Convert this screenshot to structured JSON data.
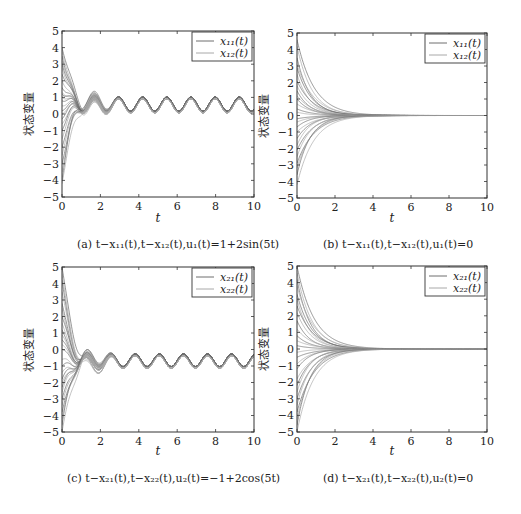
{
  "figure": {
    "panels": [
      {
        "id": "a",
        "caption": "(a) t−x₁₁(t),t−x₁₂(t),u₁(t)=1+2sin(5t)",
        "ylabel": "状态变量",
        "xlabel": "t",
        "legend": [
          "x₁₁(t)",
          "x₁₂(t)"
        ]
      },
      {
        "id": "b",
        "caption": "(b) t−x₁₁(t),t−x₁₂(t),u₁(t)=0",
        "ylabel": "状态变量",
        "xlabel": "t",
        "legend": [
          "x₁₁(t)",
          "x₁₂(t)"
        ]
      },
      {
        "id": "c",
        "caption": "(c) t−x₂₁(t),t−x₂₂(t),u₂(t)=−1+2cos(5t)",
        "ylabel": "状态变量",
        "xlabel": "t",
        "legend": [
          "x₂₁(t)",
          "x₂₂(t)"
        ]
      },
      {
        "id": "d",
        "caption": "(d) t−x₂₁(t),t−x₂₂(t),u₂(t)=0",
        "ylabel": "状态变量",
        "xlabel": "t",
        "legend": [
          "x₂₁(t)",
          "x₂₂(t)"
        ]
      }
    ],
    "colors": {
      "axis": "#333333",
      "line1": "#6e6e6e",
      "line2": "#a8a8a8",
      "background": "#ffffff"
    }
  },
  "chart_data": [
    {
      "type": "line",
      "title": "(a) t−x₁₁(t), t−x₁₂(t), u₁(t)=1+2sin(5t)",
      "xlabel": "t",
      "ylabel": "状态变量",
      "xlim": [
        0,
        10
      ],
      "ylim": [
        -5,
        5
      ],
      "xticks": [
        0,
        2,
        4,
        6,
        8,
        10
      ],
      "yticks": [
        -5,
        -4,
        -3,
        -2,
        -1,
        0,
        1,
        2,
        3,
        4,
        5
      ],
      "legend": [
        "x₁₁(t)",
        "x₁₂(t)"
      ],
      "legend_position": "upper right",
      "grid": false,
      "description": "Many trajectories from initial values in [-4.2, 4] converge by t≈3 to a periodic oscillation (period ≈1.26) in two bands",
      "initial_values": [
        4.0,
        3.8,
        3.5,
        3.2,
        3.0,
        2.8,
        2.4,
        2.0,
        1.6,
        1.3,
        1.2,
        1.0,
        0.8,
        0.5,
        0.2,
        0.0,
        -0.3,
        -0.6,
        -1.0,
        -1.5,
        -2.0,
        -2.5,
        -3.0,
        -3.5,
        -4.0,
        -4.2
      ],
      "series": [
        {
          "name": "x₁₁(t) steady state",
          "x": [
            4.4,
            5.0,
            5.6,
            6.3,
            6.9,
            7.5,
            8.2,
            8.8,
            9.4,
            10.0
          ],
          "values": [
            1.1,
            0.35,
            1.1,
            0.35,
            1.1,
            0.35,
            1.1,
            0.35,
            1.1,
            0.4
          ]
        },
        {
          "name": "x₁₂(t) steady state",
          "x": [
            4.4,
            5.0,
            5.6,
            6.3,
            6.9,
            7.5,
            8.2,
            8.8,
            9.4,
            10.0
          ],
          "values": [
            0.9,
            0.1,
            0.9,
            0.1,
            0.9,
            0.1,
            0.9,
            0.1,
            0.9,
            0.2
          ]
        }
      ],
      "mode": "oscillate",
      "center": 0.6,
      "amp": 0.42,
      "band_offset": 0.22,
      "decay": 1.6
    },
    {
      "type": "line",
      "title": "(b) t−x₁₁(t), t−x₁₂(t), u₁(t)=0",
      "xlabel": "t",
      "ylabel": "状态变量",
      "xlim": [
        0,
        10
      ],
      "ylim": [
        -5,
        5
      ],
      "xticks": [
        0,
        2,
        4,
        6,
        8,
        10
      ],
      "yticks": [
        -5,
        -4,
        -3,
        -2,
        -1,
        0,
        1,
        2,
        3,
        4,
        5
      ],
      "legend": [
        "x₁₁(t)",
        "x₁₂(t)"
      ],
      "legend_position": "upper right",
      "grid": false,
      "description": "Trajectories from initial values in [-4.2, 4.6] decay exponentially to 0 by t≈4",
      "initial_values": [
        4.6,
        4.2,
        3.5,
        3.1,
        2.9,
        2.5,
        2.1,
        1.8,
        1.5,
        1.2,
        1.0,
        0.7,
        0.4,
        0.2,
        -0.2,
        -0.4,
        -0.7,
        -1.0,
        -1.4,
        -1.8,
        -2.1,
        -2.5,
        -2.9,
        -3.2,
        -3.6,
        -4.2
      ],
      "series": [
        {
          "name": "x₁₁(t), x₁₂(t) envelope",
          "x": [
            0,
            1,
            2,
            3,
            4,
            6,
            8,
            10
          ],
          "values": [
            4.6,
            1.5,
            0.4,
            0.1,
            0.0,
            0.0,
            0.0,
            0.0
          ]
        }
      ],
      "mode": "decay",
      "decay": 1.3
    },
    {
      "type": "line",
      "title": "(c) t−x₂₁(t), t−x₂₂(t), u₂(t)=−1+2cos(5t)",
      "xlabel": "t",
      "ylabel": "状态变量",
      "xlim": [
        0,
        10
      ],
      "ylim": [
        -5,
        5
      ],
      "xticks": [
        0,
        2,
        4,
        6,
        8,
        10
      ],
      "yticks": [
        -5,
        -4,
        -3,
        -2,
        -1,
        0,
        1,
        2,
        3,
        4,
        5
      ],
      "legend": [
        "x₂₁(t)",
        "x₂₂(t)"
      ],
      "legend_position": "upper right",
      "grid": false,
      "description": "Trajectories from initial values in [-5, 5] converge by t≈3 to a periodic oscillation around -0.6 (period ≈1.26)",
      "initial_values": [
        5.0,
        4.6,
        4.2,
        3.5,
        2.8,
        2.5,
        2.0,
        1.6,
        1.2,
        0.9,
        0.6,
        0.3,
        0.0,
        -0.6,
        -1.0,
        -1.4,
        -1.8,
        -2.0,
        -2.3,
        -2.6,
        -3.0,
        -3.4,
        -3.8,
        -4.2,
        -4.6,
        -5.0
      ],
      "series": [
        {
          "name": "x₂₁(t) steady state",
          "x": [
            4.0,
            4.6,
            5.3,
            5.9,
            6.5,
            7.2,
            7.8,
            8.4,
            9.1,
            9.7
          ],
          "values": [
            -0.2,
            -0.9,
            -0.2,
            -0.9,
            -0.2,
            -0.9,
            -0.2,
            -0.9,
            -0.2,
            -0.9
          ]
        },
        {
          "name": "x₂₂(t) steady state",
          "x": [
            4.0,
            4.6,
            5.3,
            5.9,
            6.5,
            7.2,
            7.8,
            8.4,
            9.1,
            9.7
          ],
          "values": [
            -0.4,
            -1.15,
            -0.4,
            -1.15,
            -0.4,
            -1.15,
            -0.4,
            -1.15,
            -0.4,
            -1.15
          ]
        }
      ],
      "mode": "oscillate",
      "center": -0.65,
      "amp": 0.38,
      "band_offset": 0.22,
      "decay": 1.6
    },
    {
      "type": "line",
      "title": "(d) t−x₂₁(t), t−x₂₂(t), u₂(t)=0",
      "xlabel": "t",
      "ylabel": "状态变量",
      "xlim": [
        0,
        10
      ],
      "ylim": [
        -5,
        5
      ],
      "xticks": [
        0,
        2,
        4,
        6,
        8,
        10
      ],
      "yticks": [
        -5,
        -4,
        -3,
        -2,
        -1,
        0,
        1,
        2,
        3,
        4,
        5
      ],
      "legend": [
        "x₂₁(t)",
        "x₂₂(t)"
      ],
      "legend_position": "upper right",
      "grid": false,
      "description": "Trajectories from initial values in [-5, 5] decay exponentially to 0 by t≈4",
      "initial_values": [
        5.0,
        4.6,
        4.2,
        3.8,
        3.3,
        3.0,
        2.6,
        2.2,
        1.7,
        1.2,
        0.8,
        0.5,
        0.2,
        -0.2,
        -0.5,
        -0.9,
        -1.2,
        -1.8,
        -2.2,
        -2.6,
        -3.0,
        -3.4,
        -3.8,
        -4.2,
        -4.6,
        -5.0
      ],
      "series": [
        {
          "name": "x₂₁(t), x₂₂(t) envelope",
          "x": [
            0,
            1,
            2,
            3,
            4,
            6,
            8,
            10
          ],
          "values": [
            5.0,
            1.5,
            0.4,
            0.1,
            0.0,
            0.0,
            0.0,
            0.0
          ]
        }
      ],
      "mode": "decay",
      "decay": 1.3
    }
  ]
}
